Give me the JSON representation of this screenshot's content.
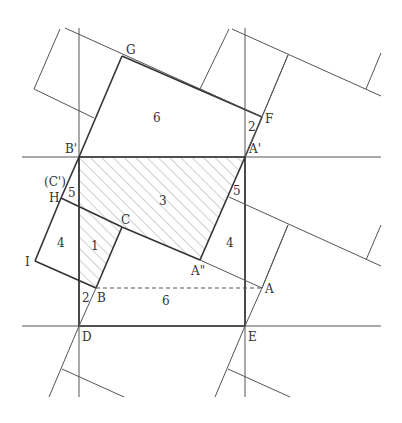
{
  "diagram": {
    "type": "geometry-tiling-figure",
    "points": {
      "G": "G",
      "F": "F",
      "B_prime": "B'",
      "A_prime": "A'",
      "C_prime": "(C')",
      "H": "H",
      "I": "I",
      "C": "C",
      "A_double_prime": "A\"",
      "A": "A",
      "B": "B",
      "D": "D",
      "E": "E"
    },
    "lengths": {
      "top_rect": "6",
      "F_segment": "2",
      "left_5": "5",
      "right_5": "5",
      "hatched_3": "3",
      "left_square_4": "4",
      "right_4": "4",
      "small_triangle_1": "1",
      "B_segment_2": "2",
      "dashed_6": "6"
    },
    "colors": {
      "line": "#333333",
      "thin_line": "#555555",
      "hatch": "#888888",
      "background": "#ffffff"
    }
  }
}
